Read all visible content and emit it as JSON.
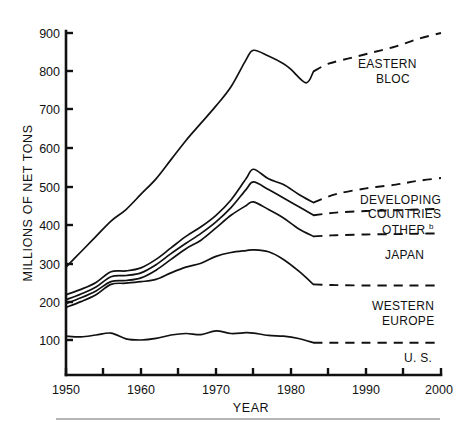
{
  "chart_data": {
    "type": "line",
    "title": "",
    "xlabel": "YEAR",
    "ylabel": "MILLIONS OF NET TONS",
    "xlim": [
      1950,
      2000
    ],
    "ylim": [
      0,
      900
    ],
    "grid": false,
    "legend_position": "right-inline-labels",
    "x_ticks": [
      1950,
      1955,
      1960,
      1965,
      1970,
      1975,
      1980,
      1985,
      1990,
      1995,
      2000
    ],
    "x_tick_labels": [
      "1950",
      "",
      "1960",
      "",
      "1970",
      "",
      "1980",
      "",
      "1990",
      "",
      "2000"
    ],
    "y_ticks": [
      100,
      200,
      300,
      400,
      500,
      600,
      700,
      800,
      900
    ],
    "y_tick_labels": [
      "100",
      "200",
      "300",
      "400",
      "500",
      "600",
      "700",
      "800",
      "900"
    ],
    "historical_range": [
      1950,
      1983
    ],
    "projection_range": [
      1983,
      2000
    ],
    "series": [
      {
        "name": "EASTERN BLOC",
        "label": "EASTERN BLOC",
        "label_lines": [
          "EASTERN",
          "BLOC"
        ],
        "style_historical": "solid",
        "style_projection": "dashed",
        "x": [
          1950,
          1952,
          1954,
          1956,
          1958,
          1960,
          1962,
          1964,
          1966,
          1968,
          1970,
          1972,
          1974,
          1975,
          1977,
          1979,
          1980,
          1982,
          1983,
          1985,
          1988,
          1991,
          1994,
          1997,
          2000
        ],
        "y": [
          290,
          330,
          370,
          410,
          440,
          480,
          520,
          570,
          620,
          665,
          710,
          760,
          830,
          855,
          840,
          820,
          805,
          770,
          800,
          820,
          835,
          850,
          865,
          885,
          900
        ]
      },
      {
        "name": "DEVELOPING COUNTRIES",
        "label": "DEVELOPING COUNTRIES",
        "label_lines": [
          "DEVELOPING",
          "COUNTRIES"
        ],
        "style_historical": "solid",
        "style_projection": "dashed",
        "x": [
          1950,
          1952,
          1954,
          1956,
          1958,
          1960,
          1962,
          1964,
          1966,
          1968,
          1970,
          1972,
          1974,
          1975,
          1977,
          1979,
          1981,
          1983,
          1986,
          1990,
          1994,
          1997,
          2000
        ],
        "y": [
          218,
          232,
          250,
          278,
          280,
          288,
          310,
          340,
          370,
          395,
          425,
          465,
          520,
          545,
          520,
          505,
          480,
          458,
          480,
          495,
          505,
          515,
          522
        ]
      },
      {
        "name": "OTHER",
        "label": "OTHER",
        "superscript": "b",
        "label_lines": [
          "OTHER"
        ],
        "style_historical": "solid",
        "style_projection": "dashed",
        "x": [
          1950,
          1952,
          1954,
          1956,
          1958,
          1960,
          1962,
          1964,
          1966,
          1968,
          1970,
          1972,
          1974,
          1975,
          1977,
          1979,
          1981,
          1983,
          1986,
          1990,
          1994,
          1997,
          2000
        ],
        "y": [
          205,
          220,
          238,
          265,
          268,
          275,
          296,
          325,
          352,
          378,
          408,
          445,
          492,
          512,
          492,
          470,
          448,
          425,
          432,
          436,
          438,
          440,
          442
        ]
      },
      {
        "name": "JAPAN",
        "label": "JAPAN",
        "label_lines": [
          "JAPAN"
        ],
        "style_historical": "solid",
        "style_projection": "dashed",
        "x": [
          1950,
          1952,
          1954,
          1956,
          1958,
          1960,
          1962,
          1964,
          1966,
          1968,
          1970,
          1972,
          1974,
          1975,
          1977,
          1979,
          1981,
          1983,
          1986,
          1990,
          1994,
          1997,
          2000
        ],
        "y": [
          195,
          210,
          228,
          252,
          255,
          262,
          282,
          310,
          338,
          360,
          392,
          425,
          450,
          460,
          440,
          418,
          390,
          370,
          373,
          375,
          376,
          377,
          378
        ]
      },
      {
        "name": "WESTERN EUROPE",
        "label": "WESTERN EUROPE",
        "label_lines": [
          "WESTERN",
          "EUROPE"
        ],
        "style_historical": "solid",
        "style_projection": "dashed",
        "x": [
          1950,
          1952,
          1954,
          1956,
          1958,
          1960,
          1962,
          1964,
          1966,
          1968,
          1970,
          1972,
          1974,
          1975,
          1977,
          1979,
          1981,
          1983,
          1986,
          1990,
          1994,
          1997,
          2000
        ],
        "y": [
          185,
          200,
          218,
          245,
          248,
          252,
          258,
          275,
          290,
          300,
          318,
          328,
          333,
          335,
          330,
          310,
          280,
          245,
          243,
          242,
          242,
          242,
          242
        ]
      },
      {
        "name": "U. S.",
        "label": "U. S.",
        "label_lines": [
          "U. S."
        ],
        "style_historical": "solid",
        "style_projection": "dashed",
        "x": [
          1950,
          1952,
          1954,
          1956,
          1958,
          1960,
          1962,
          1964,
          1966,
          1968,
          1970,
          1972,
          1974,
          1975,
          1977,
          1979,
          1981,
          1983,
          1986,
          1990,
          1994,
          1997,
          2000
        ],
        "y": [
          110,
          108,
          113,
          118,
          103,
          100,
          104,
          113,
          117,
          114,
          124,
          117,
          119,
          118,
          112,
          110,
          104,
          93,
          93,
          93,
          93,
          93,
          93
        ]
      }
    ]
  },
  "labels": {
    "eastern_bloc_1": "EASTERN",
    "eastern_bloc_2": "BLOC",
    "developing_1": "DEVELOPING",
    "developing_2": "COUNTRIES",
    "other": "OTHER",
    "other_sup": "b",
    "japan": "JAPAN",
    "western_europe_1": "WESTERN",
    "western_europe_2": "EUROPE",
    "us": "U. S."
  },
  "axes": {
    "y_title": "MILLIONS OF NET TONS",
    "x_title": "YEAR",
    "y_900": "900",
    "y_800": "800",
    "y_700": "700",
    "y_600": "600",
    "y_500": "500",
    "y_400": "400",
    "y_300": "300",
    "y_200": "200",
    "y_100": "100",
    "x_1950": "1950",
    "x_1960": "1960",
    "x_1970": "1970",
    "x_1980": "1980",
    "x_1990": "1990",
    "x_2000": "2000"
  },
  "colors": {
    "ink": "#111111",
    "paper": "#ffffff",
    "rule": "#6f6f6f"
  }
}
